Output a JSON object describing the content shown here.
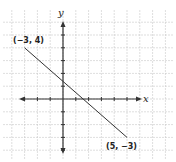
{
  "graph": {
    "type": "coordinate-plane-line-segment",
    "axis_labels": {
      "x": "x",
      "y": "y"
    },
    "grid": {
      "x_min": -4,
      "x_max": 8,
      "y_min": -4,
      "y_max": 6,
      "step": 1
    },
    "points": [
      {
        "label": "(−3, 4)",
        "x": -3,
        "y": 4
      },
      {
        "label": "(5, −3)",
        "x": 5,
        "y": -3
      }
    ],
    "colors": {
      "grid": "#c8c8c8",
      "axis": "#333333",
      "line": "#333333"
    }
  },
  "chart_data": {
    "type": "line",
    "title": "",
    "xlabel": "x",
    "ylabel": "y",
    "series": [
      {
        "name": "segment",
        "x": [
          -3,
          5
        ],
        "y": [
          4,
          -3
        ]
      }
    ],
    "annotations": [
      "(−3, 4)",
      "(5, −3)"
    ],
    "grid": true,
    "xlim": [
      -4,
      8
    ],
    "ylim": [
      -4,
      6
    ]
  }
}
